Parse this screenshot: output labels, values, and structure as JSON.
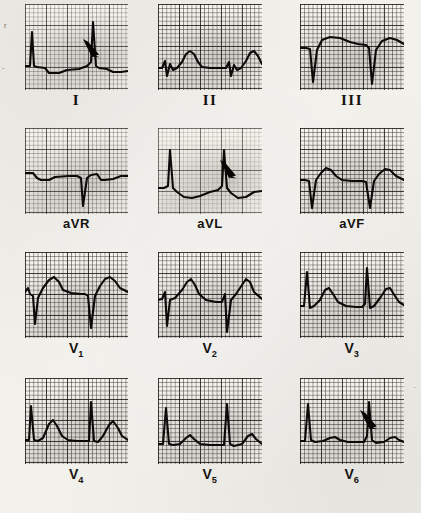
{
  "figure": {
    "type": "ecg-12-lead",
    "caption_present": false,
    "paper_background": "#f3f1ec",
    "trace_color": "#121110",
    "grid_color": "#282624",
    "rows": 4,
    "columns": 3
  },
  "leads": [
    {
      "id": "I",
      "label": "I",
      "label_style": "roman",
      "row": 0,
      "col": 0,
      "panel": {
        "x": 25,
        "y": 4,
        "w": 103,
        "h": 86,
        "grid": "normal"
      },
      "annotation": {
        "arrow": true,
        "x": 56,
        "y": 33,
        "angle": 38,
        "length": 17
      },
      "beats": 2,
      "morphology": "tall narrow R waves with slurred upstroke (delta wave), small negative T",
      "baseline_y": 0.72,
      "trace": "M0,62 L5,62 L7,28 L9,62 L12,63 L20,64 L24,69 L34,69 L42,66 L54,65 L62,62 L66,58 L68,18 L71,62 L74,64 L82,65 L88,68 L96,68 L103,67"
    },
    {
      "id": "II",
      "label": "II",
      "label_style": "roman",
      "row": 0,
      "col": 1,
      "panel": {
        "x": 158,
        "y": 4,
        "w": 104,
        "h": 86,
        "grid": "dense"
      },
      "annotation": {
        "arrow": false
      },
      "beats": 2,
      "morphology": "small rSr QRS with broad rounded upright T wave",
      "baseline_y": 0.74,
      "trace": "M0,64 L4,64 L7,57 L9,72 L12,60 L15,66 L19,64 L24,58 L28,50 L32,47 L36,50 L40,58 L44,63 L52,64 L62,64 L68,64 L71,58 L73,72 L76,61 L79,66 L83,64 L88,57 L92,49 L96,47 L100,52 L104,60"
    },
    {
      "id": "III",
      "label": "III",
      "label_style": "roman",
      "row": 0,
      "col": 2,
      "panel": {
        "x": 300,
        "y": 4,
        "w": 104,
        "h": 86,
        "grid": "dense"
      },
      "annotation": {
        "arrow": false
      },
      "beats": 2,
      "morphology": "deep QS complexes with elevated coved ST segment",
      "baseline_y": 0.55,
      "trace": "M0,44 L6,44 L10,45 L13,78 L17,46 L22,36 L30,33 L40,34 L50,38 L58,40 L66,41 L69,44 L72,80 L76,46 L82,37 L90,34 L97,36 L104,40"
    },
    {
      "id": "aVR",
      "label": "aVR",
      "label_style": "augmented",
      "row": 1,
      "col": 0,
      "panel": {
        "x": 25,
        "y": 128,
        "w": 103,
        "h": 86,
        "grid": "normal"
      },
      "annotation": {
        "arrow": false
      },
      "beats": 2,
      "morphology": "predominantly negative QS complexes, flat low-amplitude baseline",
      "baseline_y": 0.52,
      "trace": "M0,45 L8,45 L12,50 L16,52 L24,52 L30,49 L44,48 L52,48 L56,50 L58,78 L62,50 L66,47 L72,46 L76,52 L80,52 L88,51 L96,48 L103,48"
    },
    {
      "id": "aVL",
      "label": "aVL",
      "label_style": "augmented",
      "row": 1,
      "col": 1,
      "panel": {
        "x": 158,
        "y": 128,
        "w": 104,
        "h": 86,
        "grid": "light"
      },
      "annotation": {
        "arrow": true,
        "x": 60,
        "y": 30,
        "angle": 38,
        "length": 17
      },
      "beats": 2,
      "morphology": "tall narrow R waves with delta wave upstroke, inverted T wave",
      "baseline_y": 0.68,
      "trace": "M0,60 L6,60 L10,58 L12,22 L15,60 L19,64 L26,69 L34,70 L42,68 L52,64 L60,62 L64,58 L66,22 L69,60 L73,65 L80,70 L88,69 L96,64 L104,63"
    },
    {
      "id": "aVF",
      "label": "aVF",
      "label_style": "augmented",
      "row": 1,
      "col": 2,
      "panel": {
        "x": 300,
        "y": 128,
        "w": 104,
        "h": 86,
        "grid": "dense"
      },
      "annotation": {
        "arrow": false
      },
      "beats": 2,
      "morphology": "deep narrow Q wave followed by rounded upright T wave",
      "baseline_y": 0.62,
      "trace": "M0,52 L5,52 L9,53 L12,80 L16,52 L21,45 L26,40 L31,42 L36,48 L42,52 L52,53 L62,53 L66,54 L70,80 L74,53 L79,46 L85,41 L90,42 L96,48 L104,52"
    },
    {
      "id": "V1",
      "label": "V",
      "label_sub": "1",
      "label_style": "chest",
      "row": 2,
      "col": 0,
      "panel": {
        "x": 25,
        "y": 252,
        "w": 103,
        "h": 86,
        "grid": "dense"
      },
      "annotation": {
        "arrow": false
      },
      "beats": 2,
      "morphology": "QS pattern with deep S wave and broad upright T wave",
      "baseline_y": 0.5,
      "trace": "M0,40 L3,36 L5,42 L8,44 L10,72 L13,46 L18,36 L24,28 L29,25 L34,30 L38,38 L46,41 L56,42 L60,42 L63,44 L66,76 L70,44 L75,34 L80,27 L85,25 L90,29 L95,36 L103,40"
    },
    {
      "id": "V2",
      "label": "V",
      "label_sub": "2",
      "label_style": "chest",
      "row": 2,
      "col": 1,
      "panel": {
        "x": 158,
        "y": 252,
        "w": 104,
        "h": 86,
        "grid": "dense"
      },
      "annotation": {
        "arrow": false
      },
      "beats": 2,
      "morphology": "rS complex with tall asymmetric T wave",
      "baseline_y": 0.55,
      "trace": "M0,48 L4,47 L7,40 L9,74 L12,48 L17,46 L24,38 L29,30 L33,27 L37,33 L41,42 L48,48 L58,50 L64,50 L67,42 L69,80 L73,48 L78,42 L84,33 L88,27 L92,30 L96,40 L104,47"
    },
    {
      "id": "V3",
      "label": "V",
      "label_sub": "3",
      "label_style": "chest",
      "row": 2,
      "col": 2,
      "panel": {
        "x": 300,
        "y": 252,
        "w": 104,
        "h": 86,
        "grid": "dense"
      },
      "annotation": {
        "arrow": false
      },
      "beats": 2,
      "morphology": "tall R waves with distinct peaked T waves",
      "baseline_y": 0.63,
      "trace": "M0,54 L4,54 L7,20 L10,56 L14,54 L20,48 L25,38 L29,36 L33,42 L38,50 L46,54 L56,55 L62,55 L65,52 L67,16 L70,56 L74,54 L80,46 L86,37 L90,36 L95,44 L99,50 L104,53"
    },
    {
      "id": "V4",
      "label": "V",
      "label_sub": "4",
      "label_style": "chest",
      "row": 3,
      "col": 0,
      "panel": {
        "x": 25,
        "y": 378,
        "w": 103,
        "h": 86,
        "grid": "dense"
      },
      "annotation": {
        "arrow": false
      },
      "beats": 2,
      "morphology": "tall narrow R waves with prominent peaked T waves",
      "baseline_y": 0.68,
      "trace": "M0,62 L4,62 L6,28 L9,62 L13,63 L18,60 L24,46 L28,42 L32,48 L37,58 L43,62 L52,63 L60,63 L64,63 L66,24 L69,63 L73,64 L78,58 L84,47 L88,43 L93,50 L97,58 L103,62"
    },
    {
      "id": "V5",
      "label": "V",
      "label_sub": "5",
      "label_style": "chest",
      "row": 3,
      "col": 1,
      "panel": {
        "x": 158,
        "y": 378,
        "w": 104,
        "h": 86,
        "grid": "dense"
      },
      "annotation": {
        "arrow": false
      },
      "beats": 2,
      "morphology": "tall R waves with smaller low rounded T waves",
      "baseline_y": 0.72,
      "trace": "M0,66 L5,66 L8,30 L11,66 L15,67 L22,66 L28,60 L32,57 L36,61 L42,66 L52,67 L62,67 L66,67 L69,26 L72,66 L76,68 L84,66 L90,58 L94,56 L98,61 L104,66"
    },
    {
      "id": "V6",
      "label": "V",
      "label_sub": "6",
      "label_style": "chest",
      "row": 3,
      "col": 2,
      "panel": {
        "x": 300,
        "y": 378,
        "w": 104,
        "h": 86,
        "grid": "dense"
      },
      "annotation": {
        "arrow": true,
        "x": 58,
        "y": 30,
        "angle": 40,
        "length": 18
      },
      "beats": 2,
      "morphology": "tall R waves with slurred delta-wave upstroke and small flat T waves",
      "baseline_y": 0.7,
      "trace": "M0,63 L5,63 L8,26 L11,62 L15,64 L23,63 L30,60 L35,59 L40,62 L48,64 L58,64 L64,64 L67,58 L69,24 L72,62 L76,65 L84,64 L90,60 L95,59 L99,62 L104,64"
    }
  ],
  "stray_marks": [
    {
      "x": 4,
      "y": 22,
      "text": "r"
    },
    {
      "x": 2,
      "y": 64,
      "text": "-"
    },
    {
      "x": 414,
      "y": 382,
      "text": "."
    }
  ]
}
